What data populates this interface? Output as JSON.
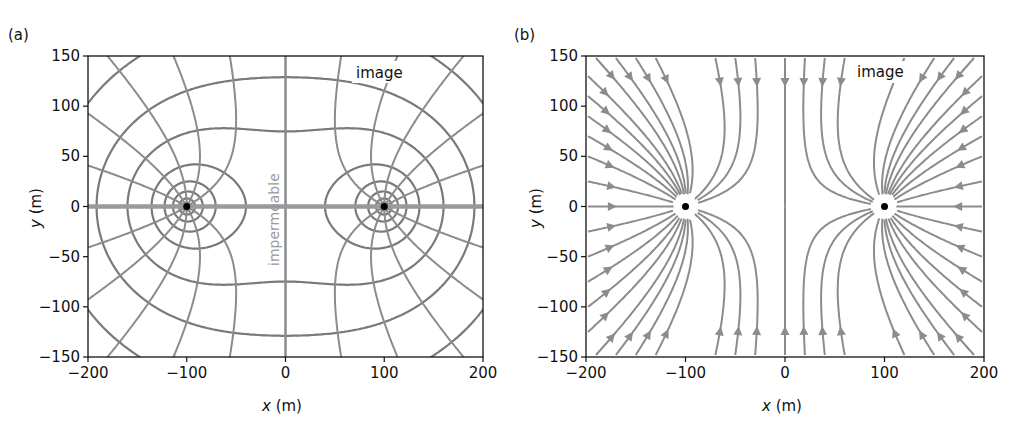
{
  "figure": {
    "panels": [
      {
        "id": "a",
        "label": "(a)",
        "xlabel_italic": "x",
        "xlabel_unit": " (m)",
        "ylabel_italic": "y",
        "ylabel_unit": " (m)",
        "xticks": [
          "−200",
          "−100",
          "0",
          "100",
          "200"
        ],
        "yticks": [
          "150",
          "100",
          "50",
          "0",
          "−50",
          "−100",
          "−150"
        ],
        "annotations": {
          "image": "image",
          "boundary": "impermeable"
        }
      },
      {
        "id": "b",
        "label": "(b)",
        "xlabel_italic": "x",
        "xlabel_unit": " (m)",
        "ylabel_italic": "y",
        "ylabel_unit": " (m)",
        "xticks": [
          "−200",
          "−100",
          "0",
          "100",
          "200"
        ],
        "yticks": [
          "150",
          "100",
          "50",
          "0",
          "−50",
          "−100",
          "−150"
        ],
        "annotations": {
          "image": "image"
        }
      }
    ],
    "colors": {
      "line": "#8c8c8c",
      "dark_line": "#7a7a7a",
      "axes": "#111111",
      "well": "#000000"
    }
  },
  "chart_data": [
    {
      "type": "contour",
      "title": "(a) Equipotentials and flow lines, well with image near impermeable boundary",
      "xlabel": "x (m)",
      "ylabel": "y (m)",
      "xlim": [
        -200,
        200
      ],
      "ylim": [
        -150,
        150
      ],
      "xticks": [
        -200,
        -100,
        0,
        100,
        200
      ],
      "yticks": [
        -150,
        -100,
        -50,
        0,
        50,
        100,
        150
      ],
      "wells": [
        {
          "x": -100,
          "y": 0,
          "label": "real"
        },
        {
          "x": 100,
          "y": 0,
          "label": "image"
        }
      ],
      "boundary": {
        "x": 0,
        "label": "impermeable"
      },
      "equipotential_levels_approx_radius": [
        5,
        10,
        20,
        40,
        75,
        140
      ],
      "annotations": [
        {
          "text": "image",
          "x": 85,
          "y": 112
        },
        {
          "text": "impermeable",
          "x": -10,
          "y": 0,
          "rotation": -90
        }
      ]
    },
    {
      "type": "streamplot",
      "title": "(b) Flow streamlines toward real and image wells",
      "xlabel": "x (m)",
      "ylabel": "y (m)",
      "xlim": [
        -200,
        200
      ],
      "ylim": [
        -150,
        150
      ],
      "xticks": [
        -200,
        -100,
        0,
        100,
        200
      ],
      "yticks": [
        -150,
        -100,
        -50,
        0,
        50,
        100,
        150
      ],
      "wells": [
        {
          "x": -100,
          "y": 0
        },
        {
          "x": 100,
          "y": 0
        }
      ],
      "annotations": [
        {
          "text": "image",
          "x": 85,
          "y": 112
        }
      ]
    }
  ]
}
